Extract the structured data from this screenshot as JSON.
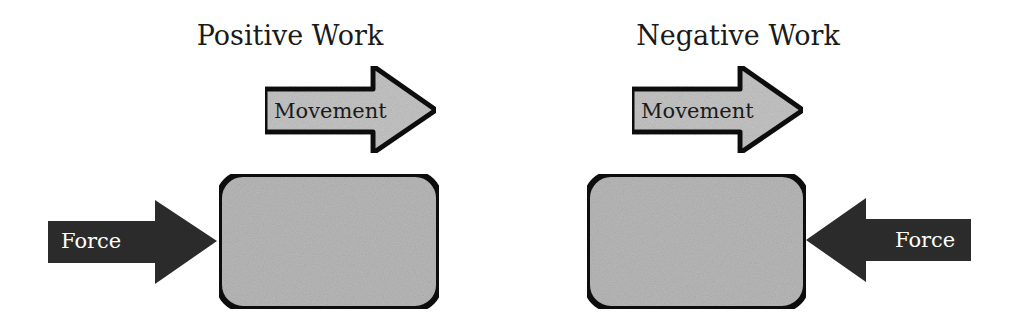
{
  "panels": [
    {
      "title": "Positive Work",
      "movement": {
        "label": "Movement",
        "direction": "right"
      },
      "force": {
        "label": "Force",
        "direction": "right",
        "side": "left"
      }
    },
    {
      "title": "Negative Work",
      "movement": {
        "label": "Movement",
        "direction": "right"
      },
      "force": {
        "label": "Force",
        "direction": "left",
        "side": "right"
      }
    }
  ],
  "colors": {
    "background": "#ffffff",
    "outline": "#111111",
    "light_fill": "#c4c4c4",
    "block_fill": "#b8b8b8",
    "force_fill": "#2b2b2b",
    "text_dark": "#1a1a1a",
    "text_light": "#ffffff"
  }
}
